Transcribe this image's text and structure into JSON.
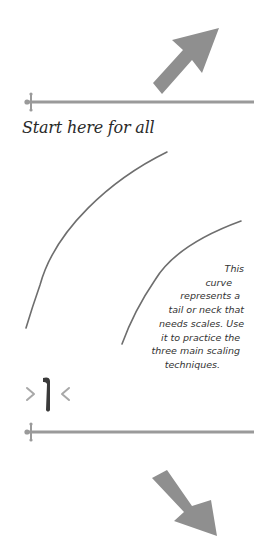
{
  "colors": {
    "arrow": "#8f8f8f",
    "rule": "#9a9a9a",
    "curve": "#6e6e6e",
    "text": "#2a2a2a",
    "nib_dark": "#3a3a3a",
    "nib_marks": "#a8a8a8"
  },
  "label": {
    "start": "Start here for all"
  },
  "note": {
    "lines": [
      "This",
      "curve",
      "represents a",
      "tail or neck that",
      "needs scales. Use",
      "it to practice the",
      "three main scaling",
      "techniques."
    ]
  },
  "icons": {
    "top_arrow": "arrow-up-right-icon",
    "bottom_arrow": "arrow-down-right-icon",
    "pen_nib": "pen-nib-width-icon"
  }
}
